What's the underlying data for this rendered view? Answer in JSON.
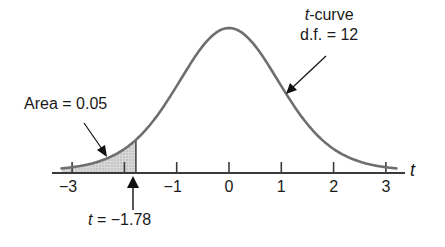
{
  "chart_data": {
    "type": "line",
    "title": "",
    "xlabel": "t",
    "ylabel": "",
    "xlim": [
      -3.3,
      3.3
    ],
    "xticks": [
      -3,
      -2,
      -1,
      0,
      1,
      2,
      3
    ],
    "xtick_labels": [
      "−3",
      "",
      "−1",
      "0",
      "1",
      "2",
      "3"
    ],
    "grid": false,
    "series": [
      {
        "name": "t-curve, d.f. = 12",
        "df": 12,
        "x_range": [
          -3.2,
          3.2
        ]
      }
    ],
    "shaded_region": {
      "from": -3.2,
      "to": -1.78,
      "area": 0.05,
      "tail": "left"
    },
    "annotations": [
      {
        "text": "Area = 0.05",
        "points_to": "shaded left tail"
      },
      {
        "text": "t-curve\nd.f. = 12",
        "points_to": "curve at t ≈ 1.1"
      },
      {
        "text": "t = −1.78",
        "points_to": "x = -1.78 on axis"
      }
    ]
  },
  "labels": {
    "curve_line1_italic": "t",
    "curve_line1_rest": "-curve",
    "curve_line2": "d.f. = 12",
    "area": "Area = 0.05",
    "t_value_italic": "t",
    "t_value_rest": " = −1.78",
    "axis_var": "t"
  },
  "ticks": [
    {
      "value": -3,
      "label": "−3"
    },
    {
      "value": -2,
      "label": ""
    },
    {
      "value": -1,
      "label": "−1"
    },
    {
      "value": 0,
      "label": "0"
    },
    {
      "value": 1,
      "label": "1"
    },
    {
      "value": 2,
      "label": "2"
    },
    {
      "value": 3,
      "label": "3"
    }
  ],
  "colors": {
    "curve": "#6e6e6e",
    "axis": "#3a3a3a",
    "shade": "#cfcfcf",
    "text": "#1a1a1a",
    "arrow": "#111111"
  }
}
